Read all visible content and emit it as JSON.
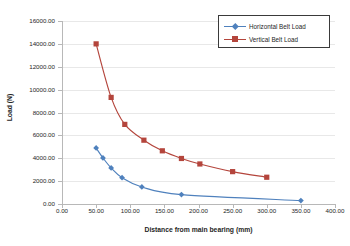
{
  "chart_data": {
    "type": "line",
    "title": "",
    "xlabel": "Distance from main bearing (mm)",
    "ylabel": "Load (N)",
    "xlim": [
      0,
      400
    ],
    "ylim": [
      0,
      16000
    ],
    "grid": true,
    "legend_position": "top-right",
    "x_ticks": [
      "0.00",
      "50.00",
      "100.00",
      "150.00",
      "200.00",
      "250.00",
      "300.00",
      "350.00",
      "400.00"
    ],
    "y_ticks": [
      "0.00",
      "2000.00",
      "4000.00",
      "6000.00",
      "8000.00",
      "10000.00",
      "12000.00",
      "14000.00",
      "16000.00"
    ],
    "series": [
      {
        "name": "Horizontal Belt Load",
        "color": "#4F81BD",
        "marker": "diamond",
        "points": [
          {
            "x": 50,
            "y": 4900
          },
          {
            "x": 60,
            "y": 4030
          },
          {
            "x": 72,
            "y": 3150
          },
          {
            "x": 88,
            "y": 2300
          },
          {
            "x": 117,
            "y": 1490
          },
          {
            "x": 175,
            "y": 820
          },
          {
            "x": 350,
            "y": 300
          }
        ]
      },
      {
        "name": "Vertical Belt Load",
        "color": "#B4453C",
        "marker": "square",
        "points": [
          {
            "x": 50,
            "y": 14000
          },
          {
            "x": 72,
            "y": 9320
          },
          {
            "x": 92,
            "y": 6960
          },
          {
            "x": 120,
            "y": 5580
          },
          {
            "x": 147,
            "y": 4650
          },
          {
            "x": 175,
            "y": 3980
          },
          {
            "x": 202,
            "y": 3500
          },
          {
            "x": 250,
            "y": 2830
          },
          {
            "x": 300,
            "y": 2340
          }
        ]
      }
    ]
  },
  "legend": {
    "entries": [
      {
        "label": "Horizontal Belt Load",
        "color": "#4F81BD",
        "marker": "diamond"
      },
      {
        "label": "Vertical Belt Load",
        "color": "#B4453C",
        "marker": "square"
      }
    ]
  },
  "axes": {
    "x_title": "Distance from main bearing (mm)",
    "y_title": "Load (N)"
  }
}
